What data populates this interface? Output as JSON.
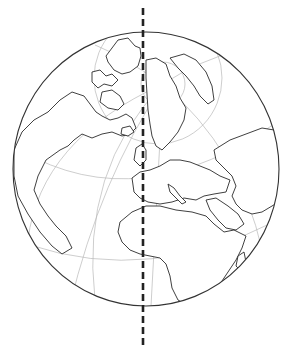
{
  "figure": {
    "view": "orthographic view centered on North Atlantic / Europe",
    "elements": [
      "globe-outline",
      "graticule",
      "continent-outlines",
      "dashed-meridian-line"
    ],
    "colors": {
      "background": "#ffffff",
      "outline": "#333333",
      "graticule": "#b8b8b8",
      "meridian_line": "#222222"
    },
    "meridian_line": {
      "style": "dashed",
      "orientation": "vertical",
      "x": 143,
      "y_start": 8,
      "y_end": 346
    }
  }
}
